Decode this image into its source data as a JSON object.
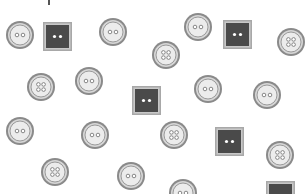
{
  "scene": {
    "width": 306,
    "height": 194,
    "background": "#ffffff",
    "colors": {
      "round_outer": "#8a8a8a",
      "round_ring": "#d6d6d6",
      "round_inner_border": "#9a9a9a",
      "round_face": "#ececec",
      "hole_stroke": "#7a7a7a",
      "square_frame": "#a8a8a8",
      "square_face": "#4a4a4a",
      "square_hole": "#ffffff"
    },
    "items": [
      {
        "type": "round",
        "holes": 2,
        "cx": 20,
        "cy": 35,
        "r": 14
      },
      {
        "type": "square",
        "holes": 2,
        "cx": 57,
        "cy": 36,
        "size": 29
      },
      {
        "type": "round",
        "holes": 2,
        "cx": 113,
        "cy": 32,
        "r": 14
      },
      {
        "type": "round",
        "holes": 2,
        "cx": 198,
        "cy": 27,
        "r": 14
      },
      {
        "type": "square",
        "holes": 2,
        "cx": 237,
        "cy": 34,
        "size": 29
      },
      {
        "type": "round",
        "holes": 4,
        "cx": 291,
        "cy": 42,
        "r": 14
      },
      {
        "type": "round",
        "holes": 4,
        "cx": 166,
        "cy": 55,
        "r": 14
      },
      {
        "type": "round",
        "holes": 4,
        "cx": 41,
        "cy": 87,
        "r": 14
      },
      {
        "type": "round",
        "holes": 2,
        "cx": 89,
        "cy": 81,
        "r": 14
      },
      {
        "type": "square",
        "holes": 2,
        "cx": 146,
        "cy": 100,
        "size": 29
      },
      {
        "type": "round",
        "holes": 2,
        "cx": 208,
        "cy": 89,
        "r": 14
      },
      {
        "type": "round",
        "holes": 2,
        "cx": 267,
        "cy": 95,
        "r": 14
      },
      {
        "type": "round",
        "holes": 2,
        "cx": 20,
        "cy": 131,
        "r": 14
      },
      {
        "type": "round",
        "holes": 2,
        "cx": 95,
        "cy": 135,
        "r": 14
      },
      {
        "type": "round",
        "holes": 4,
        "cx": 174,
        "cy": 135,
        "r": 14
      },
      {
        "type": "square",
        "holes": 2,
        "cx": 229,
        "cy": 141,
        "size": 29
      },
      {
        "type": "round",
        "holes": 4,
        "cx": 280,
        "cy": 155,
        "r": 14
      },
      {
        "type": "round",
        "holes": 4,
        "cx": 55,
        "cy": 172,
        "r": 14
      },
      {
        "type": "round",
        "holes": 2,
        "cx": 131,
        "cy": 176,
        "r": 14
      },
      {
        "type": "round",
        "holes": 2,
        "cx": 183,
        "cy": 193,
        "r": 14
      },
      {
        "type": "square",
        "holes": 2,
        "cx": 280,
        "cy": 195,
        "size": 29
      }
    ]
  }
}
